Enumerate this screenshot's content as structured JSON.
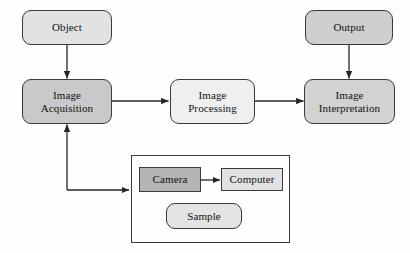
{
  "diagram": {
    "canvas": {
      "width": 410,
      "height": 253
    },
    "colors": {
      "background": "#fefefe",
      "stroke": "#3a3a3a",
      "text": "#111111",
      "fill_light": "#e9e9e9",
      "fill_medium": "#cfcfcf",
      "fill_dark": "#b9b9b9"
    },
    "nodes": {
      "object": {
        "label": "Object",
        "shape": "rounded",
        "fill": "#e2e2e2"
      },
      "output": {
        "label": "Output",
        "shape": "rounded",
        "fill": "#cfcfcf"
      },
      "image_acquisition": {
        "label_line1": "Image",
        "label_line2": "Acquisition",
        "shape": "rounded",
        "fill": "#c9c9c9"
      },
      "image_processing": {
        "label_line1": "Image",
        "label_line2": "Processing",
        "shape": "rounded",
        "fill": "#efefef"
      },
      "image_interpretation": {
        "label_line1": "Image",
        "label_line2": "Interpretation",
        "shape": "rounded",
        "fill": "#d2d2d2"
      },
      "camera": {
        "label": "Camera",
        "shape": "sharp",
        "fill": "#b5b5b5"
      },
      "computer": {
        "label": "Computer",
        "shape": "sharp",
        "fill": "#e2e2e2"
      },
      "sample": {
        "label": "Sample",
        "shape": "rounded",
        "fill": "#e4e4e4"
      },
      "apparatus_enclosure": {
        "label": "",
        "shape": "sharp",
        "fill": "transparent"
      }
    },
    "edges": [
      {
        "name": "object-to-image-acquisition",
        "from": "object",
        "to": "image_acquisition",
        "arrow": "single"
      },
      {
        "name": "image-acquisition-to-image-processing",
        "from": "image_acquisition",
        "to": "image_processing",
        "arrow": "single"
      },
      {
        "name": "image-processing-to-image-interpretation",
        "from": "image_processing",
        "to": "image_interpretation",
        "arrow": "single"
      },
      {
        "name": "output-to-image-interpretation",
        "from": "output",
        "to": "image_interpretation",
        "arrow": "single"
      },
      {
        "name": "apparatus-to-image-acquisition",
        "from": "apparatus_enclosure",
        "to": "image_acquisition",
        "arrow": "single"
      },
      {
        "name": "camera-computer-link",
        "from": "camera",
        "to": "computer",
        "arrow": "double"
      }
    ]
  }
}
